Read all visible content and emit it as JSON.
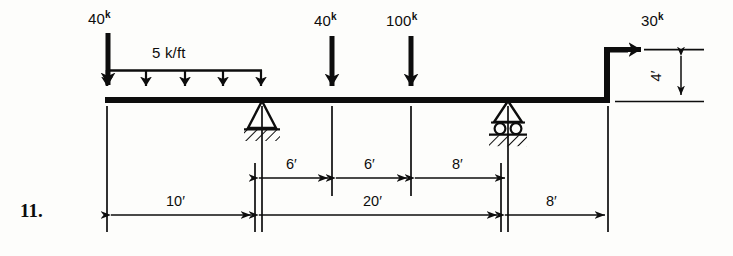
{
  "problem": {
    "number": "11."
  },
  "colors": {
    "ink": "#0d0d0d",
    "paper": "#fdfdfb"
  },
  "loads": [
    {
      "id": "left-point-load",
      "magnitude": "40",
      "unit": "k",
      "direction": "down",
      "station_ft": 0
    },
    {
      "id": "mid-point-load-40",
      "magnitude": "40",
      "unit": "k",
      "direction": "down",
      "station_ft": 16
    },
    {
      "id": "mid-point-load-100",
      "magnitude": "100",
      "unit": "k",
      "direction": "down",
      "station_ft": 22
    },
    {
      "id": "top-horizontal-load",
      "magnitude": "30",
      "unit": "k",
      "direction": "right",
      "station_ft": 38
    }
  ],
  "distributed_load": {
    "id": "udl",
    "label": "5 k/ft",
    "magnitude": 5,
    "unit": "k/ft",
    "start_ft": 0,
    "end_ft": 10,
    "arrow_count": 5
  },
  "supports": [
    {
      "id": "pin-support",
      "type": "pin",
      "station_ft": 10
    },
    {
      "id": "roller-support",
      "type": "roller",
      "station_ft": 30
    }
  ],
  "dimensions": {
    "upper_chain": [
      {
        "label": "6′",
        "value": 6
      },
      {
        "label": "6′",
        "value": 6
      },
      {
        "label": "8′",
        "value": 8
      }
    ],
    "lower_chain": [
      {
        "label": "10′",
        "value": 10
      },
      {
        "label": "20′",
        "value": 20
      },
      {
        "label": "8′",
        "value": 8
      }
    ],
    "vertical": {
      "label": "4′",
      "value": 4
    }
  },
  "labels": {
    "load_left_value": "40",
    "load_left_unit": "k",
    "load_mid40_value": "40",
    "load_mid40_unit": "k",
    "load_mid100_value": "100",
    "load_mid100_unit": "k",
    "load_top_value": "30",
    "load_top_unit": "k",
    "udl_text": "5 k/ft",
    "dim_6a": "6′",
    "dim_6b": "6′",
    "dim_8a": "8′",
    "dim_10": "10′",
    "dim_20": "20′",
    "dim_8b": "8′",
    "dim_4": "4′"
  }
}
